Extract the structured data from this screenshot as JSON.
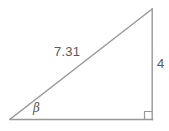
{
  "figure": {
    "type": "right-triangle-diagram",
    "background_color": "#ffffff",
    "stroke_color": "#989898",
    "text_color": "#58585a",
    "labels": {
      "hypotenuse": "7.31",
      "opposite_side": "4",
      "angle": "β"
    },
    "markers": {
      "right_angle": "square-marker"
    },
    "geometry": {
      "vertices": {
        "left": [
          10,
          119
        ],
        "bottom_right": [
          152,
          119
        ],
        "top": [
          152,
          9
        ]
      },
      "sides": {
        "base": "left to bottom-right",
        "vertical": "bottom-right to top",
        "hypotenuse": "left to top"
      }
    }
  }
}
